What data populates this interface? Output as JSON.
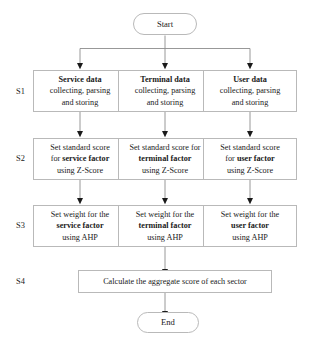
{
  "diagram": {
    "start_node": {
      "label": "Start"
    },
    "end_node": {
      "label": "End"
    },
    "stage_labels": [
      {
        "id": "S1",
        "text": "S1"
      },
      {
        "id": "S2",
        "text": "S2"
      },
      {
        "id": "S3",
        "text": "S3"
      },
      {
        "id": "S4",
        "text": "S4"
      }
    ],
    "columns": [
      {
        "id": "service",
        "name": "Service"
      },
      {
        "id": "terminal",
        "name": "Terminal"
      },
      {
        "id": "user",
        "name": "User"
      }
    ],
    "s1_nodes": [
      {
        "line1": "Service data",
        "line2": "collecting, parsing",
        "line3": "and storing"
      },
      {
        "line1": "Terminal data",
        "line2": "collecting, parsing",
        "line3": "and storing"
      },
      {
        "line1": "User data",
        "line2": "collecting, parsing",
        "line3": "and storing"
      }
    ],
    "s2_nodes": [
      {
        "line1": "Set standard score",
        "line2a": "for ",
        "line2b": "service factor",
        "line3": "using Z-Score"
      },
      {
        "line1": "Set standard score for",
        "line2a": "",
        "line2b": "terminal factor",
        "line3": "using Z-Score"
      },
      {
        "line1": "Set standard score",
        "line2a": "for ",
        "line2b": "user factor",
        "line3": "using Z-Score"
      }
    ],
    "s3_nodes": [
      {
        "line1": "Set weight for the",
        "line2": "service factor",
        "line3": "using AHP"
      },
      {
        "line1": "Set weight for the",
        "line2": "terminal factor",
        "line3": "using AHP"
      },
      {
        "line1": "Set weight for the",
        "line2": "user factor",
        "line3": "using AHP"
      }
    ],
    "s4_node": {
      "label": "Calculate the aggregate score of each sector"
    },
    "colors": {
      "border": "#b9b9b9",
      "edge": "#8c8c8c",
      "arrow": "#1a1a1a",
      "text": "#1a1a1a",
      "background": "#ffffff"
    }
  }
}
